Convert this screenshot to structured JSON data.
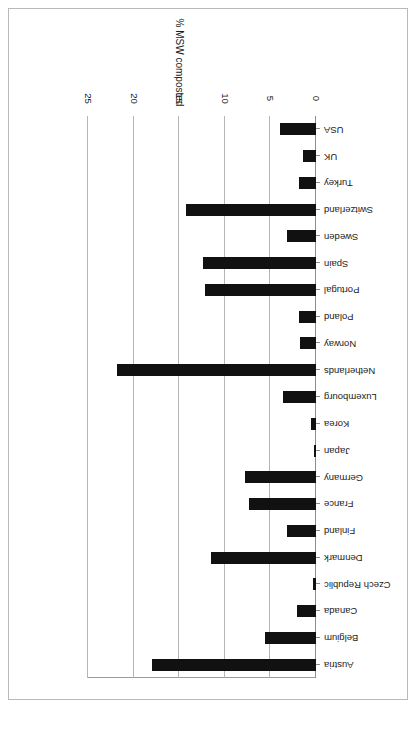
{
  "page": {
    "orientation": "rotated-180",
    "background_color": "#ffffff",
    "border_color": "#b9b9b9"
  },
  "chart_data": {
    "type": "bar",
    "orientation": "horizontal",
    "title": "",
    "subtitle": "",
    "xlabel": "% MSW composted",
    "ylabel": "",
    "xlim": [
      0,
      25
    ],
    "xticks": [
      0,
      5,
      10,
      15,
      20,
      25
    ],
    "xtick_labels": [
      "0",
      "5",
      "10",
      "15",
      "20",
      "25"
    ],
    "grid": true,
    "grid_axis": "x",
    "legend": false,
    "legend_position": "none",
    "bar_color": "#111111",
    "categories": [
      "Austria",
      "Belgium",
      "Canada",
      "Czech Republic",
      "Denmark",
      "Finland",
      "France",
      "Germany",
      "Japan",
      "Korea",
      "Luxembourg",
      "Netherlands",
      "Norway",
      "Poland",
      "Portugal",
      "Spain",
      "Sweden",
      "Switzerland",
      "Turkey",
      "UK",
      "USA"
    ],
    "values": [
      18.0,
      5.6,
      2.1,
      0.3,
      11.5,
      3.2,
      7.4,
      7.8,
      0.2,
      0.6,
      3.6,
      21.8,
      1.7,
      1.9,
      12.2,
      12.4,
      3.2,
      14.2,
      1.9,
      1.4,
      3.9
    ]
  }
}
